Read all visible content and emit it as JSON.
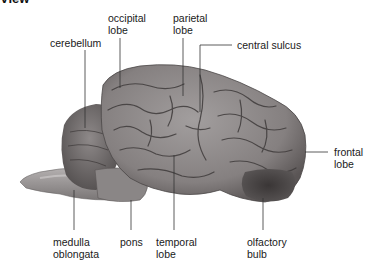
{
  "heading": "View",
  "diagram": {
    "labels": {
      "occipital_lobe": "occipital\nlobe",
      "cerebellum": "cerebellum",
      "parietal_lobe": "parietal\nlobe",
      "central_sulcus": "central sulcus",
      "frontal_lobe": "frontal\nlobe",
      "medulla_oblongata": "medulla\noblongata",
      "pons": "pons",
      "temporal_lobe": "temporal\nlobe",
      "olfactory_bulb": "olfactory\nbulb"
    }
  },
  "colors": {
    "background": "#ffffff",
    "leader_line": "#333333",
    "tissue_light": "#9a9696",
    "tissue_mid": "#7c7878",
    "tissue_dark": "#3e3a3a"
  }
}
